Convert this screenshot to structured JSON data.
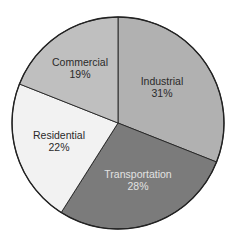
{
  "chart_data": {
    "type": "pie",
    "title": "",
    "start_angle_deg": 0,
    "direction": "clockwise",
    "categories": [
      "Industrial",
      "Transportation",
      "Residential",
      "Commercial"
    ],
    "values": [
      31,
      28,
      22,
      19
    ],
    "unit": "%",
    "colors": [
      "#b1b1b1",
      "#7b7b7b",
      "#f2f2f2",
      "#bfbfbf"
    ],
    "label_colors": [
      "#2a2a2a",
      "#e2e2e2",
      "#2a2a2a",
      "#2a2a2a"
    ],
    "labels": [
      {
        "name": "Industrial",
        "pct": "31%"
      },
      {
        "name": "Transportation",
        "pct": "28%"
      },
      {
        "name": "Residential",
        "pct": "22%"
      },
      {
        "name": "Commercial",
        "pct": "19%"
      }
    ],
    "legend": "none (labels inside slices)"
  },
  "layout": {
    "cx": 118,
    "cy": 123,
    "r": 106,
    "stroke": "#222222",
    "label_positions": [
      {
        "x": 162,
        "y1": 85,
        "y2": 97
      },
      {
        "x": 138,
        "y1": 178,
        "y2": 190
      },
      {
        "x": 59,
        "y1": 139,
        "y2": 151
      },
      {
        "x": 80,
        "y1": 66,
        "y2": 78
      }
    ]
  }
}
